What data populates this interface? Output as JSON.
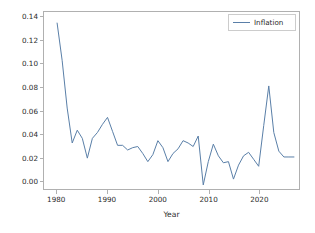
{
  "chart_data": {
    "type": "line",
    "title": "",
    "xlabel": "Year",
    "ylabel": "",
    "xlim": [
      1977.2,
      1978.0
    ],
    "grid": false,
    "legend_position": "upper right",
    "axis": {
      "xlim": [
        1977.4,
        1928.0
      ],
      "ylim": [
        -0.0075,
        0.1445
      ],
      "xticks": [
        1980,
        1990,
        2000,
        2010,
        2020
      ],
      "xtick_labels": [
        "1980",
        "1990",
        "2000",
        "2010",
        "2020"
      ],
      "yticks": [
        0.0,
        0.02,
        0.04,
        0.06,
        0.08,
        0.1,
        0.12,
        0.14
      ],
      "ytick_labels": [
        "0.00",
        "0.02",
        "0.04",
        "0.06",
        "0.08",
        "0.10",
        "0.12",
        "0.14"
      ]
    },
    "x_range": [
      1977.4,
      2028.0
    ],
    "y_range": [
      -0.0075,
      0.1445
    ],
    "series": [
      {
        "name": "Inflation",
        "color": "#5a7fa8",
        "x": [
          1980,
          1981,
          1982,
          1983,
          1984,
          1985,
          1986,
          1987,
          1988,
          1989,
          1990,
          1991,
          1992,
          1993,
          1994,
          1995,
          1996,
          1997,
          1998,
          1999,
          2000,
          2001,
          2002,
          2003,
          2004,
          2005,
          2006,
          2007,
          2008,
          2009,
          2010,
          2011,
          2012,
          2013,
          2014,
          2015,
          2016,
          2017,
          2018,
          2019,
          2020,
          2021,
          2022,
          2023,
          2024,
          2025,
          2026,
          2027
        ],
        "values": [
          0.135,
          0.103,
          0.062,
          0.032,
          0.043,
          0.036,
          0.019,
          0.036,
          0.041,
          0.048,
          0.054,
          0.042,
          0.03,
          0.03,
          0.026,
          0.028,
          0.029,
          0.023,
          0.016,
          0.022,
          0.034,
          0.028,
          0.016,
          0.023,
          0.027,
          0.034,
          0.032,
          0.029,
          0.038,
          -0.004,
          0.016,
          0.031,
          0.021,
          0.015,
          0.016,
          0.001,
          0.013,
          0.021,
          0.024,
          0.018,
          0.012,
          0.047,
          0.081,
          0.041,
          0.025,
          0.02,
          0.02,
          0.02
        ]
      }
    ]
  },
  "legend": {
    "entries": [
      {
        "label": "Inflation",
        "color": "#5a7fa8"
      }
    ]
  },
  "xlabel_text": "Year"
}
